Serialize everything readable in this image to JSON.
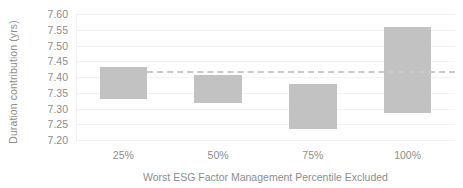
{
  "chart_data": {
    "type": "bar",
    "title": "",
    "subtitle": "",
    "xlabel": "Worst ESG Factor Management Percentile Excluded",
    "ylabel": "Duration contribution (yrs)",
    "categories": [
      "25%",
      "50%",
      "75%",
      "100%"
    ],
    "bar_style": "floating-range",
    "series": [
      {
        "name": "Duration contribution range",
        "low": [
          7.331,
          7.319,
          7.235,
          7.285
        ],
        "high": [
          7.432,
          7.405,
          7.379,
          7.558
        ]
      }
    ],
    "values": [
      7.432,
      7.405,
      7.379,
      7.558
    ],
    "ylim": [
      7.2,
      7.6
    ],
    "ytick_step": 0.05,
    "yticks": [
      "7.60",
      "7.55",
      "7.50",
      "7.45",
      "7.40",
      "7.35",
      "7.30",
      "7.25",
      "7.20"
    ],
    "ytick_values": [
      7.6,
      7.55,
      7.5,
      7.45,
      7.4,
      7.35,
      7.3,
      7.25,
      7.2
    ],
    "grid": true,
    "legend": "none",
    "annotations": [
      {
        "name": "baseline-reference-line",
        "type": "horizontal-dashed-line",
        "value": 7.42,
        "x_start_category": "25%",
        "x_end": "plot-right"
      }
    ],
    "colors": {
      "bar_fill": "#c2c2c2",
      "reference_line": "#c9c9c9",
      "gridline": "#f2f2f2",
      "axis_text": "#8d8d8d",
      "background": "#ffffff"
    }
  }
}
